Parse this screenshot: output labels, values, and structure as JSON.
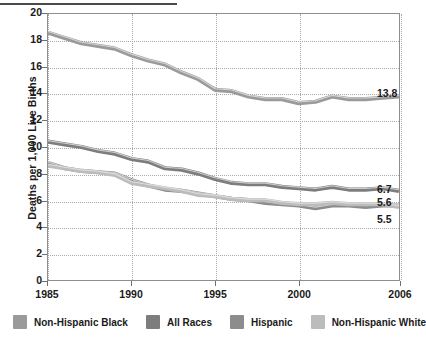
{
  "chart_data": {
    "type": "line",
    "title": "",
    "xlabel": "",
    "ylabel": "Deaths per 1,000 Live Births",
    "xlim": [
      1985,
      2006
    ],
    "ylim": [
      0,
      20
    ],
    "yticks": [
      0,
      2,
      4,
      6,
      8,
      10,
      12,
      14,
      16,
      18,
      20
    ],
    "xticks": [
      1985,
      1990,
      1995,
      2000,
      2006
    ],
    "grid": true,
    "legend_position": "bottom",
    "x": [
      1985,
      1986,
      1987,
      1988,
      1989,
      1990,
      1991,
      1992,
      1993,
      1994,
      1995,
      1996,
      1997,
      1998,
      1999,
      2000,
      2001,
      2002,
      2003,
      2004,
      2005,
      2006
    ],
    "series": [
      {
        "name": "Non-Hispanic Black",
        "color": "#9a9a9a",
        "end_label": "13.8",
        "values": [
          18.6,
          18.2,
          17.8,
          17.6,
          17.4,
          16.9,
          16.5,
          16.2,
          15.6,
          15.1,
          14.3,
          14.2,
          13.8,
          13.6,
          13.6,
          13.3,
          13.4,
          13.8,
          13.6,
          13.6,
          13.7,
          13.8
        ]
      },
      {
        "name": "All Races",
        "color": "#7d7d7d",
        "end_label": "6.7",
        "values": [
          10.4,
          10.2,
          10.0,
          9.7,
          9.5,
          9.1,
          8.9,
          8.4,
          8.3,
          8.0,
          7.6,
          7.3,
          7.2,
          7.2,
          7.0,
          6.9,
          6.8,
          7.0,
          6.8,
          6.8,
          6.9,
          6.7
        ]
      },
      {
        "name": "Hispanic",
        "color": "#8c8c8c",
        "end_label": "5.6",
        "values": [
          8.8,
          8.4,
          8.2,
          8.1,
          8.0,
          7.5,
          7.1,
          6.8,
          6.7,
          6.5,
          6.3,
          6.1,
          6.0,
          5.8,
          5.7,
          5.6,
          5.4,
          5.6,
          5.6,
          5.5,
          5.6,
          5.6
        ]
      },
      {
        "name": "Non-Hispanic White",
        "color": "#bcbcbc",
        "end_label": "5.5",
        "values": [
          8.6,
          8.4,
          8.2,
          8.1,
          7.9,
          7.3,
          7.1,
          6.9,
          6.7,
          6.4,
          6.3,
          6.1,
          6.0,
          6.0,
          5.8,
          5.7,
          5.7,
          5.8,
          5.7,
          5.7,
          5.7,
          5.5
        ]
      }
    ]
  },
  "legend": {
    "items": [
      {
        "label": "Non-Hispanic Black",
        "color": "#9a9a9a"
      },
      {
        "label": "All Races",
        "color": "#7d7d7d"
      },
      {
        "label": "Hispanic",
        "color": "#8c8c8c"
      },
      {
        "label": "Non-Hispanic White",
        "color": "#bcbcbc"
      }
    ]
  }
}
